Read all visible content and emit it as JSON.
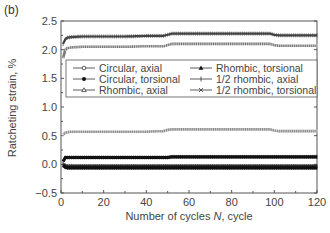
{
  "panel_label": "(b)",
  "chart_data": {
    "type": "line",
    "title": "",
    "xlabel": "Number of cycles N, cycle",
    "ylabel": "Ratcheting strain, %",
    "xlim": [
      0,
      120
    ],
    "ylim": [
      -0.5,
      2.5
    ],
    "xticks": [
      0,
      20,
      40,
      60,
      80,
      100,
      120
    ],
    "yticks": [
      -0.5,
      0.0,
      0.5,
      1.0,
      1.5,
      2.0,
      2.5
    ],
    "xtick_labels": [
      "0",
      "20",
      "40",
      "60",
      "80",
      "100",
      "120"
    ],
    "ytick_labels": [
      "−0.5",
      "0.0",
      "0.5",
      "1.0",
      "1.5",
      "2.0",
      "2.5"
    ],
    "grid": false,
    "legend_position": "upper-middle, inside plot, 2 columns",
    "x": [
      1,
      2,
      3,
      5,
      10,
      20,
      30,
      40,
      48,
      50,
      52,
      60,
      70,
      80,
      90,
      98,
      100,
      102,
      110,
      120
    ],
    "series": [
      {
        "name": "Circular, axial",
        "marker": "open-circle",
        "values": [
          1.85,
          2.0,
          2.03,
          2.04,
          2.05,
          2.05,
          2.05,
          2.06,
          2.06,
          2.08,
          2.1,
          2.1,
          2.1,
          2.1,
          2.1,
          2.1,
          2.08,
          2.07,
          2.07,
          2.07
        ]
      },
      {
        "name": "Circular, torsional",
        "marker": "filled-circle",
        "values": [
          0.05,
          0.12,
          0.12,
          0.12,
          0.12,
          0.12,
          0.12,
          0.12,
          0.12,
          0.12,
          0.13,
          0.13,
          0.13,
          0.13,
          0.13,
          0.13,
          0.13,
          0.13,
          0.13,
          0.13
        ]
      },
      {
        "name": "Rhombic, axial",
        "marker": "open-triangle",
        "values": [
          0.52,
          0.55,
          0.56,
          0.57,
          0.57,
          0.57,
          0.57,
          0.57,
          0.58,
          0.6,
          0.61,
          0.61,
          0.61,
          0.61,
          0.61,
          0.61,
          0.59,
          0.58,
          0.58,
          0.58
        ]
      },
      {
        "name": "Rhombic, torsional",
        "marker": "filled-triangle",
        "values": [
          2.1,
          2.18,
          2.21,
          2.22,
          2.23,
          2.23,
          2.23,
          2.24,
          2.24,
          2.26,
          2.28,
          2.28,
          2.28,
          2.28,
          2.28,
          2.28,
          2.26,
          2.25,
          2.25,
          2.25
        ]
      },
      {
        "name": "1/2 rhombic, axial",
        "marker": "plus",
        "values": [
          0.0,
          -0.02,
          -0.03,
          -0.03,
          -0.03,
          -0.03,
          -0.03,
          -0.03,
          -0.03,
          -0.03,
          -0.03,
          -0.03,
          -0.03,
          -0.03,
          -0.03,
          -0.03,
          -0.03,
          -0.03,
          -0.03,
          -0.03
        ]
      },
      {
        "name": "1/2 rhombic, torsional",
        "marker": "star",
        "values": [
          -0.02,
          -0.05,
          -0.06,
          -0.06,
          -0.06,
          -0.06,
          -0.06,
          -0.06,
          -0.06,
          -0.06,
          -0.06,
          -0.06,
          -0.06,
          -0.06,
          -0.06,
          -0.06,
          -0.06,
          -0.06,
          -0.06,
          -0.06
        ]
      }
    ]
  },
  "legend": {
    "items": [
      {
        "label": "Circular, axial",
        "marker": "open-circle"
      },
      {
        "label": "Circular, torsional",
        "marker": "filled-circle"
      },
      {
        "label": "Rhombic, axial",
        "marker": "open-triangle"
      },
      {
        "label": "Rhombic, torsional",
        "marker": "filled-triangle"
      },
      {
        "label": "1/2 rhombic, axial",
        "marker": "plus"
      },
      {
        "label": "1/2 rhombic, torsional",
        "marker": "star"
      }
    ]
  },
  "colors": {
    "axis": "#555555",
    "line_dark": "#222222",
    "line_mid": "#777777",
    "line_light": "#999999"
  }
}
